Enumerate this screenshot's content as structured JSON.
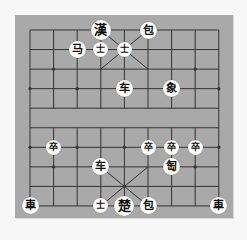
{
  "board": {
    "type": "xiangqi",
    "files": 9,
    "ranks": 10,
    "colors": {
      "board": "#a9a9a9",
      "lines": "#333333",
      "piece_bg": "#ffffff",
      "piece_text": "#111111",
      "page": "#f7f7f7"
    },
    "grid_origin": {
      "x": 30,
      "y": 30
    },
    "grid_step": {
      "x": 23.6,
      "y": 19.55
    }
  },
  "pieces": [
    {
      "label": "漢",
      "col": 3,
      "row": 0,
      "kind": "general"
    },
    {
      "label": "包",
      "col": 5,
      "row": 0,
      "kind": "normal"
    },
    {
      "label": "马",
      "col": 2,
      "row": 1,
      "kind": "normal"
    },
    {
      "label": "士",
      "col": 3,
      "row": 1,
      "kind": "small"
    },
    {
      "label": "士",
      "col": 4,
      "row": 1,
      "kind": "small"
    },
    {
      "label": "车",
      "col": 4,
      "row": 3,
      "kind": "normal"
    },
    {
      "label": "象",
      "col": 6,
      "row": 3,
      "kind": "normal"
    },
    {
      "label": "卒",
      "col": 1,
      "row": 6,
      "kind": "small"
    },
    {
      "label": "卒",
      "col": 5,
      "row": 6,
      "kind": "small"
    },
    {
      "label": "卒",
      "col": 6,
      "row": 6,
      "kind": "small"
    },
    {
      "label": "卒",
      "col": 7,
      "row": 6,
      "kind": "small"
    },
    {
      "label": "车",
      "col": 3,
      "row": 7,
      "kind": "normal"
    },
    {
      "label": "匋",
      "col": 6,
      "row": 7,
      "kind": "normal"
    },
    {
      "label": "車",
      "col": 0,
      "row": 9,
      "kind": "normal"
    },
    {
      "label": "士",
      "col": 3,
      "row": 9,
      "kind": "small"
    },
    {
      "label": "楚",
      "col": 4,
      "row": 9,
      "kind": "general"
    },
    {
      "label": "包",
      "col": 5,
      "row": 9,
      "kind": "normal"
    },
    {
      "label": "車",
      "col": 8,
      "row": 9,
      "kind": "normal"
    }
  ]
}
